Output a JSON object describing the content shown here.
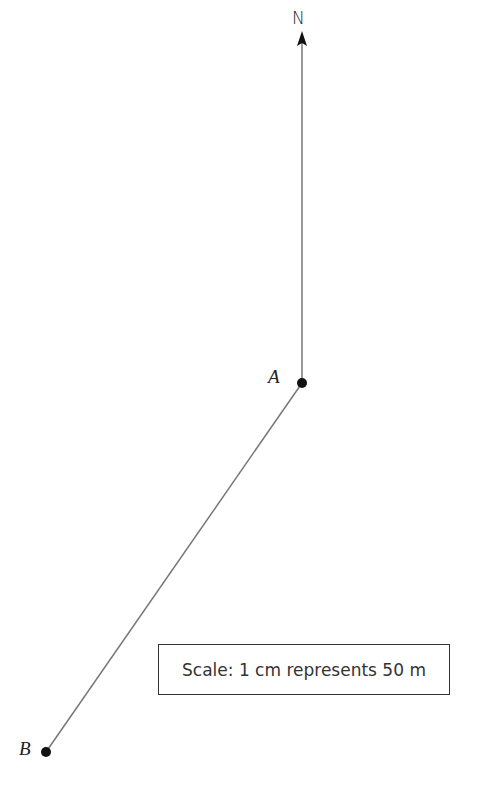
{
  "diagram": {
    "north_label": "N",
    "points": [
      {
        "label": "A",
        "x": 302,
        "y": 383
      },
      {
        "label": "B",
        "x": 46,
        "y": 752
      }
    ],
    "north_line": {
      "x": 302,
      "y_top": 33,
      "y_bottom": 383
    },
    "segment": {
      "from": "A",
      "to": "B"
    },
    "scale_text": "Scale: 1 cm represents 50 m",
    "colors": {
      "line": "#777777",
      "point": "#111111"
    }
  }
}
